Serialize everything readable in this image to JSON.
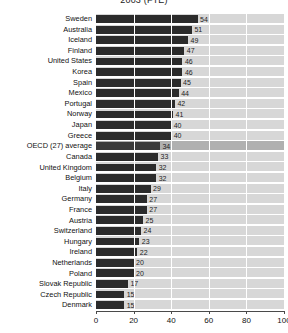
{
  "chart_data": {
    "type": "bar",
    "orientation": "horizontal",
    "title": "2003 (FTE)",
    "xlabel": "",
    "ylabel": "",
    "xlim": [
      0,
      100
    ],
    "xticks": [
      0,
      20,
      40,
      60,
      80,
      100
    ],
    "grid": true,
    "legend": null,
    "highlight_category": "OECD (27) average",
    "categories": [
      "Sweden",
      "Australia",
      "Iceland",
      "Finland",
      "United States",
      "Korea",
      "Spain",
      "Mexico",
      "Portugal",
      "Norway",
      "Japan",
      "Greece",
      "OECD (27) average",
      "Canada",
      "United Kingdom",
      "Belgium",
      "Italy",
      "Germany",
      "France",
      "Austria",
      "Switzerland",
      "Hungary",
      "Ireland",
      "Netherlands",
      "Poland",
      "Slovak Republic",
      "Czech Republic",
      "Denmark"
    ],
    "values": [
      54,
      51,
      49,
      47,
      46,
      46,
      45,
      44,
      42,
      41,
      40,
      40,
      34,
      33,
      32,
      32,
      29,
      27,
      27,
      25,
      24,
      23,
      22,
      20,
      20,
      17,
      15,
      15
    ],
    "colors": {
      "bar": "#2b2b2b",
      "highlight_bar": "#3a3a3a",
      "plot_background": "#d7d7d7",
      "highlight_band": "#b0b0b0",
      "gridline": "#ffffff",
      "axis": "#4a4a4a",
      "text": "#111111"
    }
  }
}
